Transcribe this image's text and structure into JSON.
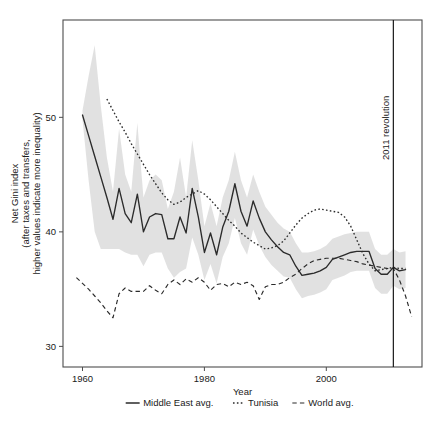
{
  "chart_data": {
    "type": "line",
    "title": "",
    "xlabel": "Year",
    "ylabel": "Net Gini index\n(after taxes and transfers,\nhigher values indicate more inequality)",
    "ylabel_lines": [
      "Net Gini index",
      "(after taxes and transfers,",
      "higher values indicate more inequality)"
    ],
    "xlim": [
      1956.8,
      2015.7
    ],
    "ylim": [
      28.2,
      58.5
    ],
    "xticks": [
      1960,
      1980,
      2000
    ],
    "xticklabels": [
      "1960",
      "1980",
      "2000"
    ],
    "yticks": [
      30,
      40,
      50
    ],
    "yticklabels": [
      "30",
      "40",
      "50"
    ],
    "grid": false,
    "legend_position": "bottom",
    "accent_color": "#2b2b2b",
    "band_color": "#c8c8c8",
    "annotations": [
      {
        "text": "2011 revolution",
        "x": 2011,
        "orientation": "vertical",
        "type": "vline"
      }
    ],
    "series": [
      {
        "name": "Middle East avg.",
        "style": "solid",
        "x": [
          1960,
          1961,
          1962,
          1963,
          1964,
          1965,
          1966,
          1967,
          1968,
          1969,
          1970,
          1971,
          1972,
          1973,
          1974,
          1975,
          1976,
          1977,
          1978,
          1979,
          1980,
          1981,
          1982,
          1983,
          1984,
          1985,
          1986,
          1987,
          1988,
          1989,
          1990,
          1991,
          1992,
          1993,
          1994,
          1995,
          1996,
          1997,
          1998,
          1999,
          2000,
          2001,
          2002,
          2003,
          2004,
          2005,
          2006,
          2007,
          2008,
          2009,
          2010,
          2011,
          2012,
          2013
        ],
        "values": [
          50.2,
          48.4,
          46.6,
          44.8,
          43.0,
          41.1,
          43.8,
          41.6,
          40.8,
          43.3,
          40.0,
          41.3,
          41.6,
          41.5,
          39.4,
          39.4,
          41.3,
          39.9,
          43.8,
          41.3,
          38.2,
          39.9,
          38.0,
          40.4,
          41.8,
          44.2,
          41.8,
          40.5,
          42.7,
          41.2,
          40.0,
          39.3,
          38.7,
          38.2,
          38.0,
          37.0,
          36.2,
          36.3,
          36.4,
          36.6,
          36.9,
          37.6,
          37.8,
          38.0,
          38.2,
          38.3,
          38.3,
          38.3,
          36.8,
          36.3,
          36.3,
          36.9,
          36.6,
          36.7
        ]
      },
      {
        "name": "Tunisia",
        "style": "dotted",
        "x": [
          1964,
          1965,
          1966,
          1967,
          1968,
          1969,
          1970,
          1971,
          1972,
          1973,
          1974,
          1975,
          1976,
          1977,
          1978,
          1979,
          1980,
          1981,
          1982,
          1983,
          1984,
          1985,
          1986,
          1987,
          1988,
          1989,
          1990,
          1991,
          1992,
          1993,
          1994,
          1995,
          1996,
          1997,
          1998,
          1999,
          2000,
          2001,
          2002,
          2003,
          2004,
          2005,
          2006,
          2007,
          2008,
          2009,
          2010,
          2011,
          2012,
          2013
        ],
        "values": [
          51.6,
          50.6,
          49.6,
          48.7,
          47.7,
          46.8,
          45.9,
          45.0,
          44.2,
          43.4,
          42.8,
          42.4,
          42.6,
          43.0,
          43.3,
          43.6,
          43.3,
          42.8,
          42.2,
          41.6,
          41.0,
          40.5,
          39.9,
          39.5,
          39.1,
          38.8,
          38.5,
          38.6,
          38.8,
          39.2,
          39.9,
          40.6,
          41.2,
          41.6,
          41.9,
          42.0,
          41.9,
          41.8,
          41.7,
          41.3,
          40.5,
          39.3,
          38.1,
          37.2,
          36.6,
          36.7,
          36.8,
          36.9,
          36.8,
          36.8
        ]
      },
      {
        "name": "World avg.",
        "style": "dashed",
        "x": [
          1959,
          1960,
          1961,
          1962,
          1963,
          1964,
          1965,
          1966,
          1967,
          1968,
          1969,
          1970,
          1971,
          1972,
          1973,
          1974,
          1975,
          1976,
          1977,
          1978,
          1979,
          1980,
          1981,
          1982,
          1983,
          1984,
          1985,
          1986,
          1987,
          1988,
          1989,
          1990,
          1991,
          1992,
          1993,
          1994,
          1995,
          1996,
          1997,
          1998,
          1999,
          2000,
          2001,
          2002,
          2003,
          2004,
          2005,
          2006,
          2007,
          2008,
          2009,
          2010,
          2011,
          2012,
          2013,
          2014
        ],
        "values": [
          36.0,
          35.5,
          35.0,
          34.4,
          33.8,
          33.1,
          32.5,
          34.6,
          35.1,
          34.8,
          34.8,
          34.8,
          35.3,
          34.9,
          34.6,
          35.4,
          35.8,
          35.4,
          35.9,
          35.6,
          36.0,
          35.6,
          34.9,
          35.4,
          35.5,
          35.2,
          35.6,
          35.4,
          35.6,
          35.3,
          34.1,
          35.2,
          35.4,
          35.4,
          35.6,
          36.0,
          36.3,
          36.8,
          37.2,
          37.5,
          37.6,
          37.7,
          37.7,
          37.7,
          37.6,
          37.5,
          37.4,
          37.2,
          37.1,
          37.0,
          36.9,
          36.8,
          36.8,
          35.8,
          34.4,
          32.6
        ]
      }
    ],
    "band": {
      "name": "Middle East avg. range",
      "x": [
        1960,
        1961,
        1962,
        1963,
        1964,
        1965,
        1966,
        1967,
        1968,
        1969,
        1970,
        1971,
        1972,
        1973,
        1974,
        1975,
        1976,
        1977,
        1978,
        1979,
        1980,
        1981,
        1982,
        1983,
        1984,
        1985,
        1986,
        1987,
        1988,
        1989,
        1990,
        1991,
        1992,
        1993,
        1994,
        1995,
        1996,
        1997,
        1998,
        1999,
        2000,
        2001,
        2002,
        2003,
        2004,
        2005,
        2006,
        2007,
        2008,
        2009,
        2010,
        2011,
        2012,
        2013
      ],
      "upper": [
        50.6,
        53.6,
        56.3,
        51.0,
        46.5,
        43.5,
        49.0,
        45.0,
        43.5,
        49.5,
        43.0,
        44.5,
        45.0,
        44.5,
        42.0,
        43.5,
        46.5,
        43.0,
        48.0,
        44.5,
        40.5,
        42.5,
        40.5,
        43.0,
        44.5,
        47.0,
        44.5,
        43.0,
        45.0,
        43.5,
        42.2,
        41.5,
        40.8,
        40.3,
        40.0,
        39.0,
        38.2,
        38.2,
        38.3,
        38.5,
        38.8,
        39.4,
        39.6,
        39.8,
        39.9,
        40.0,
        40.0,
        40.0,
        38.5,
        38.0,
        38.0,
        38.5,
        38.2,
        38.3
      ],
      "lower": [
        49.8,
        44.5,
        40.0,
        38.5,
        38.5,
        38.5,
        38.5,
        38.2,
        38.0,
        38.0,
        37.0,
        38.0,
        38.2,
        38.2,
        36.8,
        36.0,
        36.5,
        36.8,
        39.5,
        38.0,
        35.8,
        37.2,
        35.5,
        37.8,
        39.0,
        41.2,
        39.0,
        38.0,
        40.2,
        38.8,
        37.8,
        37.1,
        36.6,
        36.1,
        36.0,
        35.0,
        34.2,
        34.4,
        34.5,
        34.7,
        35.0,
        35.8,
        36.0,
        36.2,
        36.5,
        36.6,
        36.6,
        36.6,
        35.1,
        34.6,
        34.6,
        35.3,
        35.0,
        35.1
      ]
    }
  },
  "legend": {
    "items": [
      {
        "label": "Middle East avg.",
        "style": "solid"
      },
      {
        "label": "Tunisia",
        "style": "dotted"
      },
      {
        "label": "World avg.",
        "style": "dashed"
      }
    ]
  }
}
